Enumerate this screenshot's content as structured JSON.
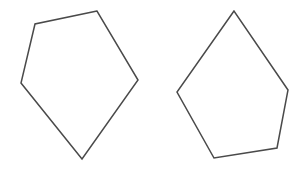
{
  "figure": {
    "type": "shape-comparison-diagram",
    "background_color": "#ffffff",
    "width": 295,
    "height": 169,
    "stroke_color": "#4a4a4a",
    "stroke_width": 1.5,
    "fill": "none",
    "shape_count": 2,
    "shapes": [
      {
        "id": "left-pentagon",
        "name": "pentagon",
        "label": "",
        "sides": 5,
        "position": "left",
        "orientation_note": "apex near top, pointed vertex at bottom",
        "points": "97,11 35,24 21,83 82,159 138,80",
        "vertices": [
          {
            "x": 97,
            "y": 11
          },
          {
            "x": 35,
            "y": 24
          },
          {
            "x": 21,
            "y": 83
          },
          {
            "x": 82,
            "y": 159
          },
          {
            "x": 138,
            "y": 80
          }
        ]
      },
      {
        "id": "right-pentagon",
        "name": "pentagon",
        "label": "",
        "sides": 5,
        "position": "right",
        "orientation_note": "same pentagon rotated, apex at top",
        "points": "234,11 177,92 214,158 277,148 288,90",
        "vertices": [
          {
            "x": 234,
            "y": 11
          },
          {
            "x": 177,
            "y": 92
          },
          {
            "x": 214,
            "y": 158
          },
          {
            "x": 277,
            "y": 148
          },
          {
            "x": 288,
            "y": 90
          }
        ]
      }
    ]
  }
}
